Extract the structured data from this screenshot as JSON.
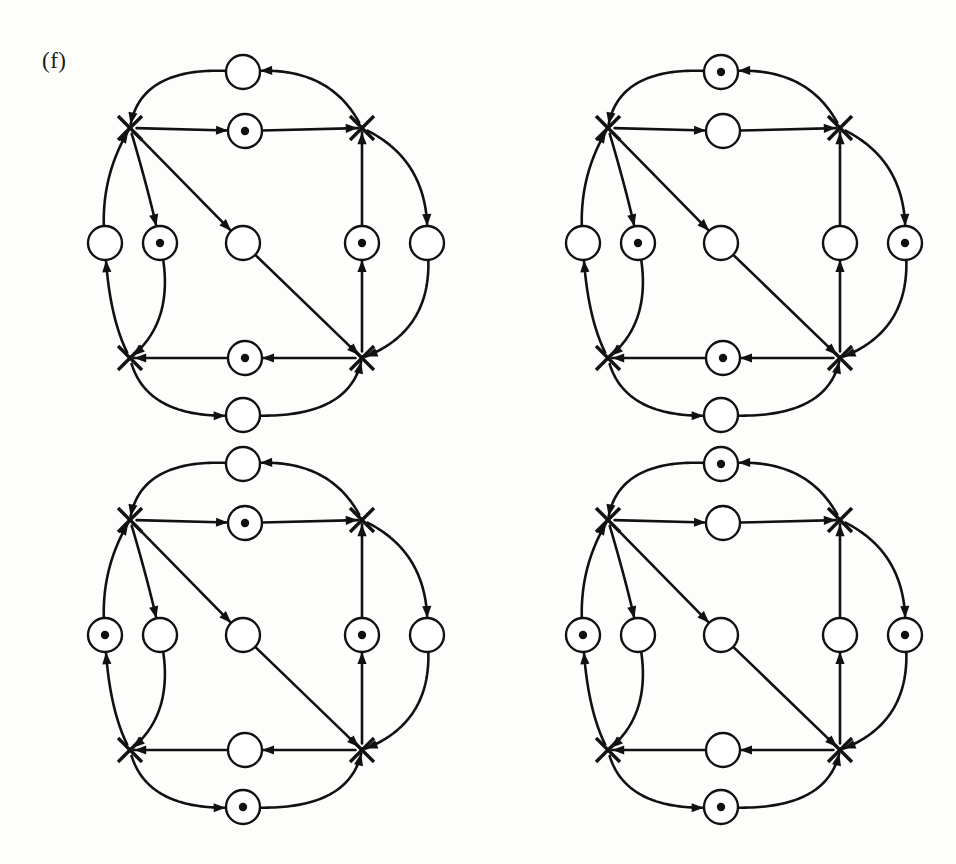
{
  "figure": {
    "label": "(f)",
    "label_x": 42,
    "label_y": 48,
    "background_color": "#fdfdfb",
    "ink_color": "#111111",
    "width": 956,
    "height": 864,
    "panel_count": 4
  },
  "geometry": {
    "place_radius": 17,
    "token_radius": 4.2,
    "transition_half": 12,
    "panel_origins": [
      {
        "id": "panel-top-left",
        "ox": 0,
        "oy": 0
      },
      {
        "id": "panel-top-right",
        "ox": 478,
        "oy": 0
      },
      {
        "id": "panel-bottom-left",
        "ox": 0,
        "oy": 392
      },
      {
        "id": "panel-bottom-right",
        "ox": 478,
        "oy": 392
      }
    ],
    "nodes": {
      "t_tl": {
        "x": 130,
        "y": 128,
        "type": "transition"
      },
      "t_tr": {
        "x": 362,
        "y": 128,
        "type": "transition"
      },
      "t_bl": {
        "x": 130,
        "y": 358,
        "type": "transition"
      },
      "t_br": {
        "x": 362,
        "y": 358,
        "type": "transition"
      },
      "p_top": {
        "x": 243,
        "y": 72,
        "type": "place"
      },
      "p_upper_mid": {
        "x": 245,
        "y": 131,
        "type": "place"
      },
      "p_left_outer": {
        "x": 105,
        "y": 243,
        "type": "place"
      },
      "p_left_inner": {
        "x": 160,
        "y": 243,
        "type": "place"
      },
      "p_center": {
        "x": 243,
        "y": 243,
        "type": "place"
      },
      "p_right_inner": {
        "x": 362,
        "y": 243,
        "type": "place"
      },
      "p_right_outer": {
        "x": 427,
        "y": 243,
        "type": "place"
      },
      "p_lower_mid": {
        "x": 245,
        "y": 358,
        "type": "place"
      },
      "p_bottom": {
        "x": 243,
        "y": 415,
        "type": "place"
      }
    }
  },
  "panels": [
    {
      "id": "panel-top-left",
      "name": "petri-net-panel-1",
      "position": "top-left",
      "tokens": {
        "p_top": 0,
        "p_upper_mid": 1,
        "p_left_outer": 0,
        "p_left_inner": 1,
        "p_center": 0,
        "p_right_inner": 1,
        "p_right_outer": 0,
        "p_lower_mid": 1,
        "p_bottom": 0
      },
      "total_tokens": 4
    },
    {
      "id": "panel-top-right",
      "name": "petri-net-panel-2",
      "position": "top-right",
      "tokens": {
        "p_top": 1,
        "p_upper_mid": 0,
        "p_left_outer": 0,
        "p_left_inner": 1,
        "p_center": 0,
        "p_right_inner": 0,
        "p_right_outer": 1,
        "p_lower_mid": 1,
        "p_bottom": 0
      },
      "total_tokens": 4
    },
    {
      "id": "panel-bottom-left",
      "name": "petri-net-panel-3",
      "position": "bottom-left",
      "tokens": {
        "p_top": 0,
        "p_upper_mid": 1,
        "p_left_outer": 1,
        "p_left_inner": 0,
        "p_center": 0,
        "p_right_inner": 1,
        "p_right_outer": 0,
        "p_lower_mid": 0,
        "p_bottom": 1
      },
      "total_tokens": 4
    },
    {
      "id": "panel-bottom-right",
      "name": "petri-net-panel-4",
      "position": "bottom-right",
      "tokens": {
        "p_top": 1,
        "p_upper_mid": 0,
        "p_left_outer": 1,
        "p_left_inner": 0,
        "p_center": 0,
        "p_right_inner": 0,
        "p_right_outer": 1,
        "p_lower_mid": 0,
        "p_bottom": 1
      },
      "total_tokens": 4
    }
  ],
  "arcs": [
    {
      "id": "a1",
      "from": "t_tl",
      "to": "p_upper_mid",
      "shape": "straight"
    },
    {
      "id": "a2",
      "from": "p_upper_mid",
      "to": "t_tr",
      "shape": "straight"
    },
    {
      "id": "a3",
      "from": "t_tr",
      "to": "p_top",
      "shape": "curve-top-right"
    },
    {
      "id": "a4",
      "from": "p_top",
      "to": "t_tl",
      "shape": "curve-top-left"
    },
    {
      "id": "a5",
      "from": "t_tl",
      "to": "p_left_inner",
      "shape": "curve-left-in"
    },
    {
      "id": "a6",
      "from": "p_left_inner",
      "to": "t_bl",
      "shape": "curve-left-in-down"
    },
    {
      "id": "a7",
      "from": "p_left_outer",
      "to": "t_tl",
      "shape": "curve-left-out-up"
    },
    {
      "id": "a8",
      "from": "t_bl",
      "to": "p_left_outer",
      "shape": "curve-left-out-down"
    },
    {
      "id": "a9",
      "from": "t_tl",
      "to": "p_center",
      "shape": "diagonal"
    },
    {
      "id": "a10",
      "from": "p_center",
      "to": "t_br",
      "shape": "diagonal"
    },
    {
      "id": "a11",
      "from": "p_right_inner",
      "to": "t_tr",
      "shape": "straight-vert"
    },
    {
      "id": "a12",
      "from": "t_br",
      "to": "p_right_inner",
      "shape": "straight-vert"
    },
    {
      "id": "a13",
      "from": "t_tr",
      "to": "p_right_outer",
      "shape": "curve-right-out-down"
    },
    {
      "id": "a14",
      "from": "p_right_outer",
      "to": "t_br",
      "shape": "curve-right-out-up"
    },
    {
      "id": "a15",
      "from": "t_br",
      "to": "p_lower_mid",
      "shape": "straight"
    },
    {
      "id": "a16",
      "from": "p_lower_mid",
      "to": "t_bl",
      "shape": "straight"
    },
    {
      "id": "a17",
      "from": "t_bl",
      "to": "p_bottom",
      "shape": "curve-bottom-left"
    },
    {
      "id": "a18",
      "from": "p_bottom",
      "to": "t_br",
      "shape": "curve-bottom-right"
    }
  ]
}
